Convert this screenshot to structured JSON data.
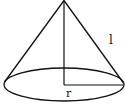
{
  "diagram": {
    "labels": {
      "slant_height": "l",
      "radius": "r"
    },
    "colors": {
      "stroke": "#111111",
      "background": "#ffffff"
    }
  }
}
